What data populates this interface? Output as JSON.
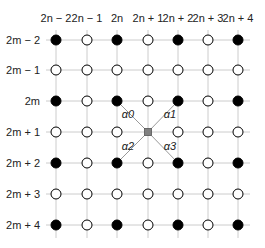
{
  "diagram": {
    "col_labels": [
      "2n − 2",
      "2n − 1",
      "2n",
      "2n + 1",
      "2n + 2",
      "2n + 3",
      "2n + 4"
    ],
    "row_labels": [
      "2m − 2",
      "2m − 1",
      "2m",
      "2m + 1",
      "2m + 2",
      "2m + 3",
      "2m + 4"
    ],
    "center_label": "",
    "diagonal_labels": [
      "α0",
      "α1",
      "α2",
      "α3"
    ],
    "colors": {
      "filled": "#000000",
      "open": "#ffffff",
      "center": "#808080",
      "grid": "#cccccc",
      "diagonal": "#999999"
    }
  }
}
